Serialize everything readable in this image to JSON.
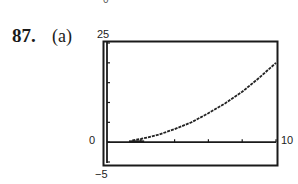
{
  "header": {
    "top_fragment": "0",
    "problem_number": "87.",
    "part_label": "(a)"
  },
  "labels": {
    "ymax": "25",
    "ymin": "−5",
    "xmin": "0",
    "xmax": "10"
  },
  "chart_data": {
    "type": "line",
    "title": "",
    "xlabel": "",
    "ylabel": "",
    "xlim": [
      0,
      10
    ],
    "ylim": [
      -5,
      25
    ],
    "x_tick_interval": 2,
    "y_tick_interval": 5,
    "grid": false,
    "legend": null,
    "annotations": [
      "Window labels: Xmin 0, Xmax 10, Ymin −5, Ymax 25"
    ],
    "series": [
      {
        "name": "curve",
        "x": [
          1.5,
          2,
          3,
          4,
          5,
          6,
          7,
          8,
          9,
          10
        ],
        "y": [
          0.45,
          0.8,
          1.8,
          3.3,
          5.0,
          7.3,
          9.8,
          12.7,
          16.2,
          20.0
        ]
      }
    ]
  }
}
